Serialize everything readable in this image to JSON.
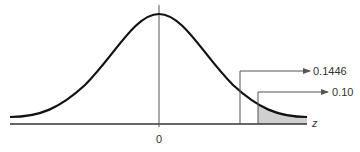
{
  "diagram": {
    "type": "standard normal distribution with right-tail areas",
    "axis_label": "z",
    "center_label": "0",
    "annotations": [
      {
        "label": "0.1446",
        "description": "area to the right of the first cutoff"
      },
      {
        "label": "0.10",
        "description": "shaded right-tail area"
      }
    ],
    "colors": {
      "curve": "#111111",
      "axis": "#333333",
      "shade": "#cfcfcf",
      "leader": "#555555"
    }
  }
}
